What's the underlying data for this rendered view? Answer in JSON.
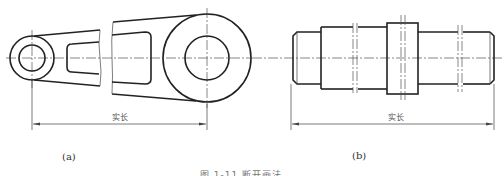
{
  "figure": {
    "panel_a": {
      "label": "(a)",
      "dimension_text": "实长",
      "description": "Tapered link/lever with small boss (double circle) at left and large boss (double circle) at right, with broken-out middle section"
    },
    "panel_b": {
      "label": "(b)",
      "dimension_text": "实长",
      "description": "Stepped shaft with chamfered ends and break lines, horizontal centerline"
    },
    "caption": "图 1-11 断开画法"
  },
  "colors": {
    "line": "#222222",
    "thin_line": "#444444",
    "background": "#ffffff"
  }
}
